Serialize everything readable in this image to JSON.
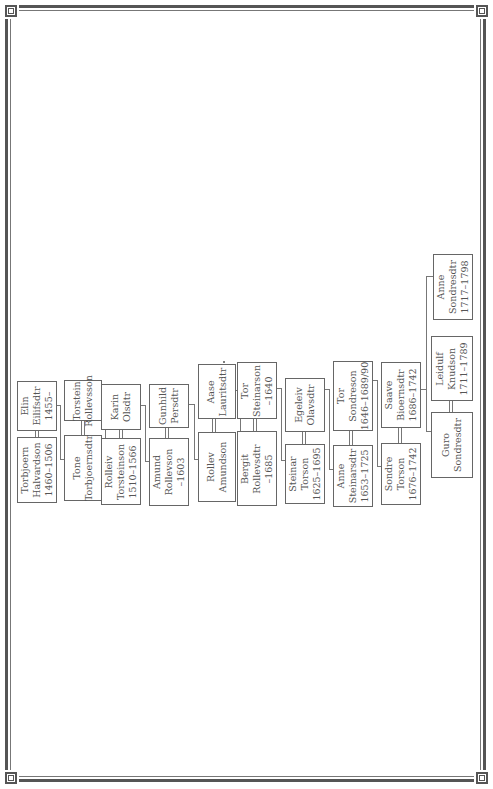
{
  "chart": {
    "type": "family-tree",
    "orientation": "rotated-90-ccw",
    "couples": [
      {
        "husband": {
          "name1": "Torbjoern",
          "name2": "Halvardson",
          "dates": "1460–1506"
        },
        "wife": {
          "name1": "Elin",
          "name2": "Eilifsdtr",
          "dates": "1455–"
        }
      },
      {
        "husband": {
          "name1": "Torstein",
          "name2": "Rollevsson",
          "dates": ""
        },
        "wife": {
          "name1": "Tone",
          "name2": "Torbjoernsdtr",
          "dates": ""
        }
      },
      {
        "husband": {
          "name1": "Rolleiv",
          "name2": "Torsteinson",
          "dates": "1510–1566"
        },
        "wife": {
          "name1": "Karin",
          "name2": "Olsdtr",
          "dates": ""
        }
      },
      {
        "husband": {
          "name1": "Amund",
          "name2": "Rollevson",
          "dates": "–1603"
        },
        "wife": {
          "name1": "Gunhild",
          "name2": "Persdtr",
          "dates": ""
        }
      },
      {
        "husband": {
          "name1": "Rollev",
          "name2": "Amundson",
          "dates": ""
        },
        "wife": {
          "name1": "Aase",
          "name2": "Lauritsdtr",
          "dates": ""
        }
      },
      {
        "husband": {
          "name1": "Tor",
          "name2": "Steinarson",
          "dates": "–1640"
        },
        "wife": {
          "name1": "Bergit",
          "name2": "Rollevsdtr",
          "dates": "–1685"
        }
      },
      {
        "husband": {
          "name1": "Steinar",
          "name2": "Torson",
          "dates": "1625–1695"
        },
        "wife": {
          "name1": "Egeleiv",
          "name2": "Olavsdtr",
          "dates": ""
        }
      },
      {
        "husband": {
          "name1": "Tor",
          "name2": "Sondreson",
          "dates": "1646–1689/90"
        },
        "wife": {
          "name1": "Anne",
          "name2": "Steinarsdtr",
          "dates": "1653–1725"
        }
      },
      {
        "husband": {
          "name1": "Sondre",
          "name2": "Torson",
          "dates": "1676–1742"
        },
        "wife": {
          "name1": "Saave",
          "name2": "Bioernsdtr",
          "dates": "1686–1742"
        }
      },
      {
        "husband": {
          "name1": "Leidulf",
          "name2": "Knudson",
          "dates": "1711–1789"
        },
        "wife": {
          "name1": "Guro",
          "name2": "Sondresdtr",
          "dates": ""
        }
      }
    ],
    "sibling": {
      "name1": "Anne",
      "name2": "Sondresdtr",
      "dates": "1717–1798"
    }
  }
}
